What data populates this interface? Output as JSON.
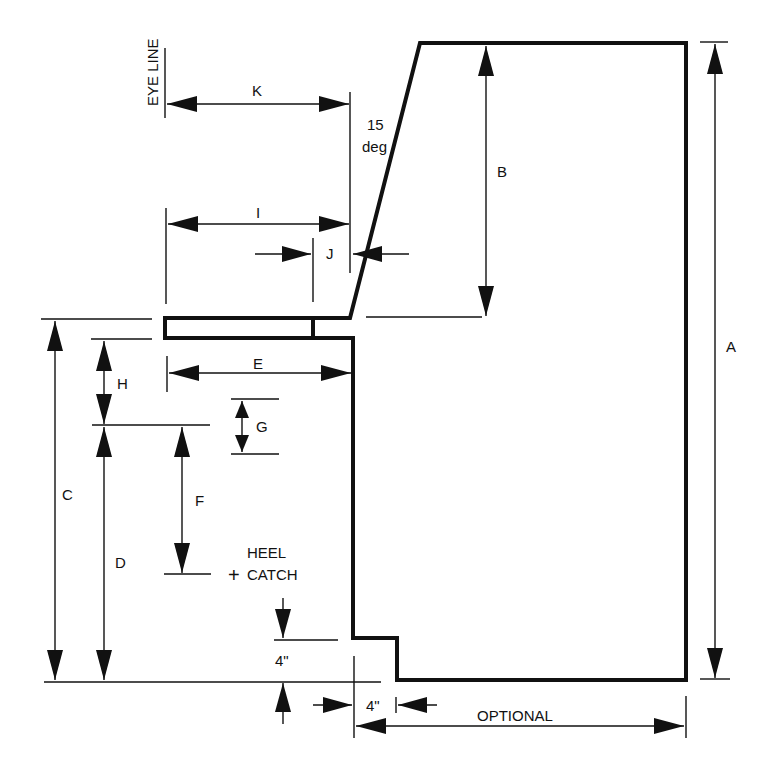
{
  "diagram": {
    "labels": {
      "eye_line": "EYE LINE",
      "k": "K",
      "angle_value": "15",
      "angle_unit": "deg",
      "b": "B",
      "a": "A",
      "i": "I",
      "j": "J",
      "e": "E",
      "h": "H",
      "g": "G",
      "c": "C",
      "f": "F",
      "d": "D",
      "heel": "HEEL",
      "catch": "CATCH",
      "plus": "+",
      "toe_height": "4\"",
      "toe_depth": "4\"",
      "optional": "OPTIONAL"
    },
    "colors": {
      "line": "#111111",
      "background": "#ffffff"
    }
  }
}
